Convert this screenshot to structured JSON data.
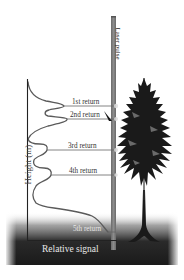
{
  "figure": {
    "type": "lidar-waveform-diagram",
    "laser_pulse_label": "Laser pulse",
    "y_axis_label": "Height (m)",
    "x_axis_label": "Relative signal",
    "returns": [
      {
        "label": "1st return",
        "y": 106
      },
      {
        "label": "2nd return",
        "y": 118
      },
      {
        "label": "3rd return",
        "y": 150
      },
      {
        "label": "4th return",
        "y": 175
      },
      {
        "label": "5th return",
        "y": 232
      }
    ],
    "colors": {
      "background": "#ffffff",
      "ground_dark": "#1e1e1e",
      "pulse_bar": "#7a7a7a",
      "waveform": "#555555",
      "axis": "#222222",
      "tree": "#1a1a1a",
      "label_text": "#333333",
      "xlabel_text": "#e8e8e8"
    }
  }
}
